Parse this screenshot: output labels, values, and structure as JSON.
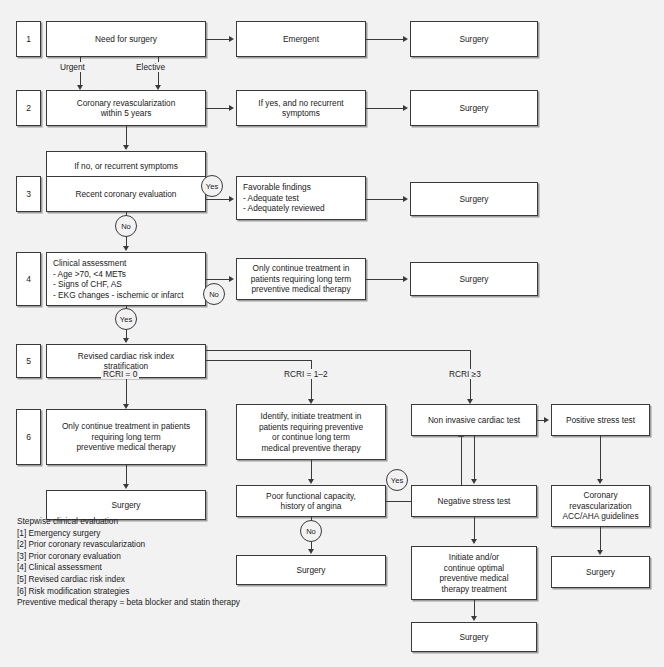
{
  "steps": {
    "s1": "1",
    "s2": "2",
    "s3": "3",
    "s4": "4",
    "s5": "5",
    "s6": "6"
  },
  "nodes": {
    "need_for_surgery": "Need for surgery",
    "emergent": "Emergent",
    "surgery_r1": "Surgery",
    "coronary_revasc": "Coronary revascularization\nwithin 5 years",
    "if_yes_no_recurrent": "If yes, and no recurrent\nsymptoms",
    "surgery_r2": "Surgery",
    "if_no_recurrent": "If no, or recurrent symptoms",
    "recent_coronary_eval": "Recent coronary evaluation",
    "favorable_findings_title": "Favorable findings",
    "favorable_findings_items": [
      "-  Adequate test",
      "-  Adequately reviewed"
    ],
    "surgery_r3": "Surgery",
    "clinical_assessment_title": "Clinical assessment",
    "clinical_assessment_items": [
      "-  Age >70, <4 METs",
      "-  Signs of CHF, AS",
      "-  EKG changes - ischemic or infarct"
    ],
    "only_continue_r4": "Only continue treatment in\npatients requiring long term\npreventive medical therapy",
    "surgery_r4": "Surgery",
    "revised_cardiac_risk": "Revised cardiac risk index\nstratification",
    "only_continue_r6": "Only continue treatment in patients\nrequiring long term\npreventive medical therapy",
    "surgery_col1": "Surgery",
    "identify_initiate": "Identify, initiate treatment in\npatients requiring preventive\nor continue long term\nmedical preventive therapy",
    "poor_functional": "Poor functional capacity,\nhistory of angina",
    "surgery_col2": "Surgery",
    "non_invasive_test": "Non invasive cardiac test",
    "negative_stress_test": "Negative stress test",
    "initiate_continue_optimal": "Initiate and/or\ncontinue optimal\npreventive medical\ntherapy treatment",
    "surgery_col3": "Surgery",
    "positive_stress_test": "Positive stress test",
    "coronary_revasc_guidelines": "Coronary\nrevascularization\nACC/AHA guidelines",
    "surgery_col4": "Surgery"
  },
  "edge_labels": {
    "urgent": "Urgent",
    "elective": "Elective",
    "rcri_0": "RCRI = 0",
    "rcri_1_2": "RCRI = 1–2",
    "rcri_3": "RCRI ≥3"
  },
  "decisions": {
    "yes_step3": "Yes",
    "no_step3": "No",
    "no_step4": "No",
    "yes_step4": "Yes",
    "yes_poor_functional": "Yes",
    "no_poor_functional": "No"
  },
  "legend": {
    "heading": "Stepwise clinical evaluation",
    "items": [
      "[1]  Emergency surgery",
      "[2]  Prior coronary revascularization",
      "[3]  Prior coronary evaluation",
      "[4]  Clinical assessment",
      "[5]  Revised cardiac risk index",
      "[6]  Risk modification strategies"
    ],
    "footnote": "Preventive medical therapy = beta blocker and statin therapy"
  },
  "colors": {
    "background": "#f2f2f2",
    "box_fill": "#ffffff",
    "stroke": "#3a3a3a",
    "text": "#1a1a1a"
  }
}
